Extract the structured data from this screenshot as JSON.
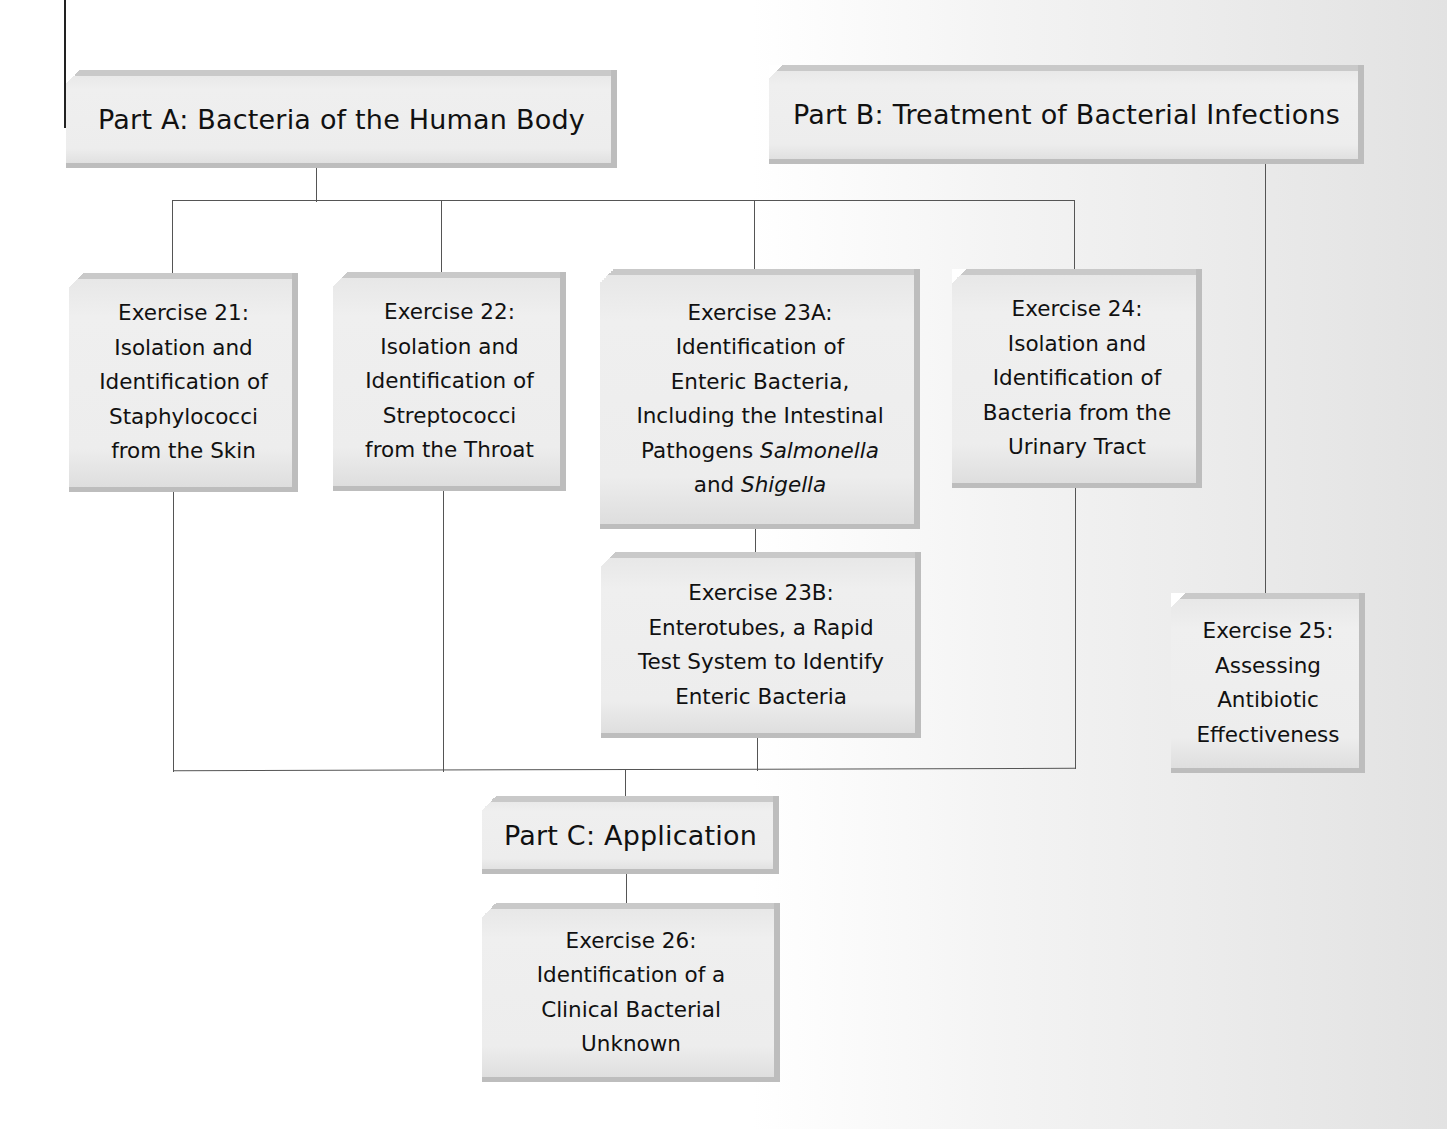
{
  "diagram": {
    "parts": [
      {
        "id": "A",
        "label": "Part A: Bacteria of the Human Body"
      },
      {
        "id": "B",
        "label": "Part B: Treatment of Bacterial Infections"
      },
      {
        "id": "C",
        "label": "Part C: Application"
      }
    ],
    "exercises": {
      "ex21": {
        "lines": [
          "Exercise 21:",
          "Isolation and",
          "Identification of",
          "Staphylococci",
          "from the Skin"
        ]
      },
      "ex22": {
        "lines": [
          "Exercise 22:",
          "Isolation and",
          "Identification of",
          "Streptococci",
          "from the Throat"
        ]
      },
      "ex23a": {
        "lines": [
          "Exercise 23A:",
          "Identification of",
          "Enteric Bacteria,",
          "Including the Intestinal"
        ],
        "line5_prefix": "Pathogens ",
        "line5_italic": "Salmonella",
        "line6_prefix": "and ",
        "line6_italic": "Shigella"
      },
      "ex23b": {
        "lines": [
          "Exercise 23B:",
          "Enterotubes, a Rapid",
          "Test System to Identify",
          "Enteric Bacteria"
        ]
      },
      "ex24": {
        "lines": [
          "Exercise 24:",
          "Isolation and",
          "Identification of",
          "Bacteria from the",
          "Urinary Tract"
        ]
      },
      "ex25": {
        "lines": [
          "Exercise 25:",
          "Assessing",
          "Antibiotic",
          "Effectiveness"
        ]
      },
      "ex26": {
        "lines": [
          "Exercise 26:",
          "Identification of a",
          "Clinical Bacterial",
          "Unknown"
        ]
      }
    },
    "connections": [
      [
        "Part A",
        "Exercise 21"
      ],
      [
        "Part A",
        "Exercise 22"
      ],
      [
        "Part A",
        "Exercise 23A"
      ],
      [
        "Part A",
        "Exercise 24"
      ],
      [
        "Exercise 23A",
        "Exercise 23B"
      ],
      [
        "Part B",
        "Exercise 25"
      ],
      [
        "Exercise 21",
        "Part C"
      ],
      [
        "Exercise 22",
        "Part C"
      ],
      [
        "Exercise 23B",
        "Part C"
      ],
      [
        "Exercise 24",
        "Part C"
      ],
      [
        "Part C",
        "Exercise 26"
      ]
    ]
  }
}
